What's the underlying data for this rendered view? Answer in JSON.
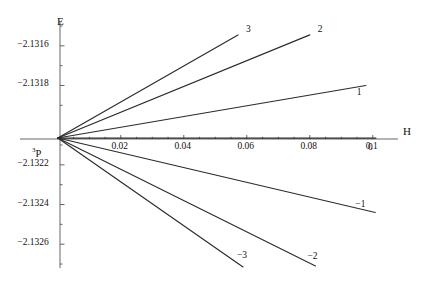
{
  "chart_data": {
    "type": "line",
    "title": "",
    "subtitle": "",
    "xlabel": "H",
    "ylabel": "E",
    "xlim": [
      -0.012,
      0.108
    ],
    "ylim": [
      -2.13272,
      -2.13148
    ],
    "grid": false,
    "legend": "inline-endpoint-labels",
    "origin_label": "3P",
    "origin_label_superscript": "3",
    "origin_label_base": "P",
    "origin_point": {
      "H": 0.0,
      "E": -2.132065
    },
    "x_ticks": [
      {
        "value": 0.02,
        "label": "0.02"
      },
      {
        "value": 0.04,
        "label": "0.04"
      },
      {
        "value": 0.06,
        "label": "0.06"
      },
      {
        "value": 0.08,
        "label": "0.08"
      },
      {
        "value": 0.1,
        "label": "0.1"
      }
    ],
    "x_minor_ticks": [
      0.005,
      0.01,
      0.015,
      0.025,
      0.03,
      0.035,
      0.045,
      0.05,
      0.055,
      0.065,
      0.07,
      0.075,
      0.085,
      0.09,
      0.095
    ],
    "y_ticks": [
      {
        "value": -2.1316,
        "label": "-2.1316"
      },
      {
        "value": -2.1318,
        "label": "-2.1318"
      },
      {
        "value": -2.1322,
        "label": "-2.1322"
      },
      {
        "value": -2.1324,
        "label": "-2.1324"
      },
      {
        "value": -2.1326,
        "label": "-2.1326"
      }
    ],
    "y_minor_ticks": [
      -2.1315,
      -2.1317,
      -2.1319,
      -2.1321,
      -2.1323,
      -2.1325,
      -2.1327
    ],
    "series": [
      {
        "name": "3",
        "label": "3",
        "x": [
          0.0,
          0.0572
        ],
        "y": [
          -2.132065,
          -2.131545
        ],
        "color": "#2b2b2b"
      },
      {
        "name": "2",
        "label": "2",
        "x": [
          0.0,
          0.08
        ],
        "y": [
          -2.132065,
          -2.131545
        ],
        "color": "#2b2b2b"
      },
      {
        "name": "1",
        "label": "1",
        "x": [
          0.0,
          0.0978
        ],
        "y": [
          -2.132065,
          -2.1318
        ],
        "color": "#2b2b2b"
      },
      {
        "name": "0",
        "label": "0",
        "x": [
          0.0,
          0.101
        ],
        "y": [
          -2.132065,
          -2.132065
        ],
        "color": "#2b2b2b"
      },
      {
        "name": "-1",
        "label": "-1",
        "x": [
          0.0,
          0.1008
        ],
        "y": [
          -2.132065,
          -2.13244
        ],
        "color": "#2b2b2b"
      },
      {
        "name": "-2",
        "label": "-2",
        "x": [
          0.0,
          0.0818
        ],
        "y": [
          -2.132065,
          -2.13271
        ],
        "color": "#2b2b2b"
      },
      {
        "name": "-3",
        "label": "-3",
        "x": [
          0.0,
          0.0588
        ],
        "y": [
          -2.132065,
          -2.132715
        ],
        "color": "#2b2b2b"
      }
    ],
    "curve_end_labels": [
      {
        "name": "3",
        "text": "3"
      },
      {
        "name": "2",
        "text": "2"
      },
      {
        "name": "1",
        "text": "1"
      },
      {
        "name": "0",
        "text": "0"
      },
      {
        "name": "-1",
        "text": "-1"
      },
      {
        "name": "-2",
        "text": "-2"
      },
      {
        "name": "-3",
        "text": "-3"
      }
    ]
  },
  "axes": {
    "x_title": "H",
    "y_title": "E"
  }
}
